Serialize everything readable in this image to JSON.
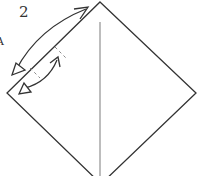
{
  "diagram": {
    "step_label": "2",
    "edge_mark": "A",
    "colors": {
      "paper_edge": "#333333",
      "center_crease": "#9a9a9a",
      "arrow": "#333333",
      "fold_tick": "#8a8a8a",
      "background": "#ffffff"
    },
    "shapes": {
      "square_paper": {
        "type": "diamond",
        "vertices": [
          [
            100,
            2
          ],
          [
            196,
            93
          ],
          [
            101,
            184
          ],
          [
            7,
            93
          ]
        ]
      },
      "center_crease": {
        "type": "line",
        "from": [
          100,
          22
        ],
        "to": [
          100,
          176
        ]
      },
      "long_arrow": {
        "type": "double-headed-curved-arrow",
        "from": [
          14,
          74
        ],
        "to": [
          88,
          7
        ],
        "head_style": "hollow"
      },
      "short_arrow": {
        "type": "double-headed-curved-arrow",
        "from": [
          22,
          92
        ],
        "to": [
          58,
          57
        ],
        "head_style": "hollow"
      },
      "fold_ticks": [
        {
          "from": [
            55,
            47
          ],
          "to": [
            66,
            58
          ]
        },
        {
          "from": [
            30,
            68
          ],
          "to": [
            40,
            78
          ]
        }
      ]
    }
  }
}
